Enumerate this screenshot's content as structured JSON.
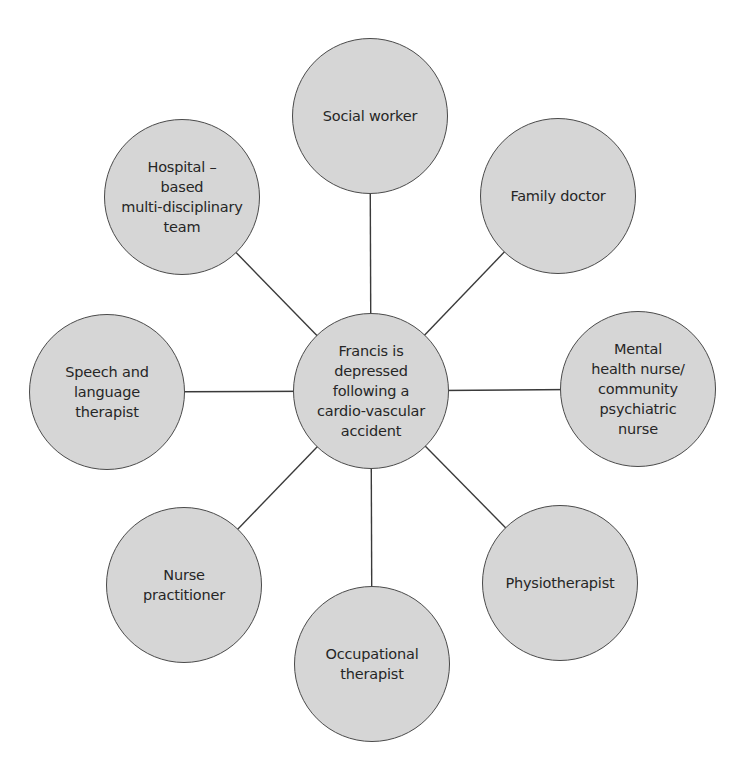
{
  "diagram": {
    "type": "hub-and-spoke",
    "center": {
      "label": "Francis is\ndepressed\nfollowing a\ncardio-vascular\naccident",
      "x": 371,
      "y": 391
    },
    "nodes": [
      {
        "id": "social-worker",
        "label": "Social worker",
        "x": 370,
        "y": 116
      },
      {
        "id": "family-doctor",
        "label": "Family doctor",
        "x": 558,
        "y": 196
      },
      {
        "id": "mental-health-nurse",
        "label": "Mental\nhealth nurse/\ncommunity\npsychiatric\nnurse",
        "x": 638,
        "y": 389
      },
      {
        "id": "physiotherapist",
        "label": "Physiotherapist",
        "x": 560,
        "y": 583
      },
      {
        "id": "occupational-therapist",
        "label": "Occupational\ntherapist",
        "x": 372,
        "y": 664
      },
      {
        "id": "nurse-practitioner",
        "label": "Nurse\npractitioner",
        "x": 184,
        "y": 585
      },
      {
        "id": "speech-language-therapist",
        "label": "Speech and\nlanguage\ntherapist",
        "x": 107,
        "y": 392
      },
      {
        "id": "hospital-mdt",
        "label": "Hospital –\nbased\nmulti-disciplinary\nteam",
        "x": 182,
        "y": 197
      }
    ],
    "colors": {
      "node_fill": "#d6d6d6",
      "node_border": "#4a4a4a",
      "connector": "#3a3a3a",
      "text": "#262626"
    }
  }
}
